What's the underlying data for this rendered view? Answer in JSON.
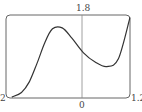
{
  "chart_data": {
    "type": "line",
    "title": "",
    "xlabel": "",
    "ylabel": "",
    "xlim": [
      -2,
      1.2
    ],
    "ylim": [
      0,
      1.8
    ],
    "tick_labels": {
      "x_left": "-2",
      "x_zero": "0",
      "x_right": "1.2",
      "y_top": "1.8"
    },
    "grid": false,
    "series": [
      {
        "name": "f(x)",
        "x": [
          -1.85,
          -1.6,
          -1.4,
          -1.2,
          -1.0,
          -0.8,
          -0.55,
          -0.3,
          0.0,
          0.3,
          0.6,
          0.9,
          1.2
        ],
        "y": [
          0.02,
          0.12,
          0.35,
          0.75,
          1.2,
          1.5,
          1.52,
          1.3,
          0.98,
          0.78,
          0.68,
          0.85,
          1.75
        ]
      }
    ]
  },
  "labels": {
    "x_left": "2",
    "x_zero": "0",
    "x_right": "1.2",
    "y_top": "1.8"
  }
}
